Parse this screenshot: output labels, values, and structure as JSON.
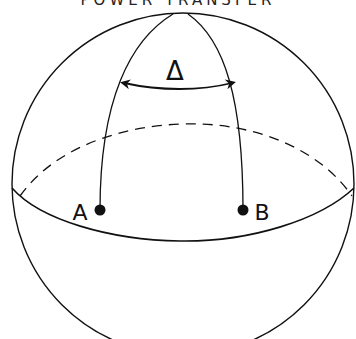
{
  "title": "POWER TRANSFER",
  "diagram": {
    "type": "sphere-great-circle",
    "angle_symbol": "Δ",
    "points": [
      {
        "label": "A"
      },
      {
        "label": "B"
      }
    ],
    "stroke_color": "#111111",
    "background_color": "#ffffff"
  }
}
